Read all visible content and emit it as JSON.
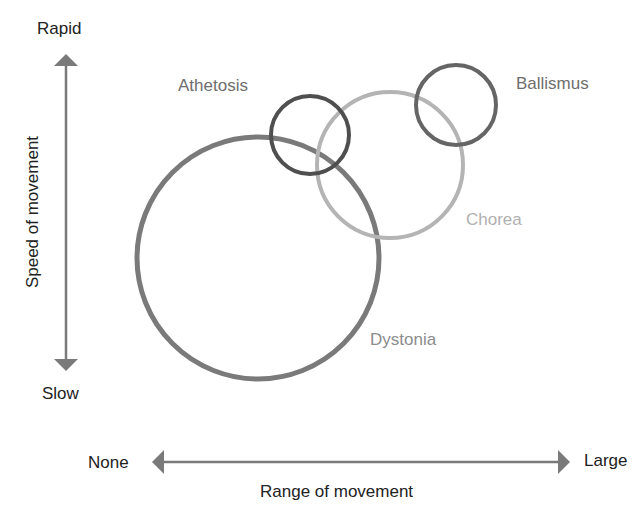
{
  "diagram": {
    "type": "overlapping-circles",
    "y_axis": {
      "title": "Speed of movement",
      "top_label": "Rapid",
      "bottom_label": "Slow"
    },
    "x_axis": {
      "title": "Range of movement",
      "left_label": "None",
      "right_label": "Large"
    },
    "circles": [
      {
        "name": "Dystonia",
        "cx": 258,
        "cy": 258,
        "r": 121,
        "stroke": "#7a7a7a",
        "label_color": "#8c8c8c"
      },
      {
        "name": "Athetosis",
        "cx": 310,
        "cy": 135,
        "r": 39,
        "stroke": "#4f4f4f",
        "label_color": "#6e6e6e"
      },
      {
        "name": "Chorea",
        "cx": 390,
        "cy": 165,
        "r": 73,
        "stroke": "#b4b4b4",
        "label_color": "#b0b0b0"
      },
      {
        "name": "Ballismus",
        "cx": 456,
        "cy": 105,
        "r": 40,
        "stroke": "#656565",
        "label_color": "#6e6e6e"
      }
    ],
    "colors": {
      "axis": "#7a7a7a",
      "text": "#222222"
    }
  }
}
